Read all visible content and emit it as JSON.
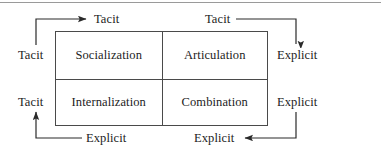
{
  "figure": {
    "type": "2x2-matrix-with-cycle-arrows",
    "line_color": "#4a4a4a",
    "text_color": "#1c1c1c",
    "background_color": "#ffffff"
  },
  "matrix": {
    "cells": [
      {
        "id": "socialization",
        "label": "Socialization",
        "row": "top",
        "col": "left"
      },
      {
        "id": "articulation",
        "label": "Articulation",
        "row": "top",
        "col": "right"
      },
      {
        "id": "internalization",
        "label": "Internalization",
        "row": "bottom",
        "col": "left"
      },
      {
        "id": "combination",
        "label": "Combination",
        "row": "bottom",
        "col": "right"
      }
    ]
  },
  "edge_labels": {
    "top_left": "Tacit",
    "top_right": "Tacit",
    "left_top": "Tacit",
    "left_bottom": "Tacit",
    "right_top": "Explicit",
    "right_bottom": "Explicit",
    "bottom_left": "Explicit",
    "bottom_right": "Explicit"
  },
  "arrows": [
    {
      "id": "left-up-to-top",
      "from": "left_top",
      "to": "top_left",
      "direction": "up-then-right",
      "head": "right"
    },
    {
      "id": "top-right-to-right",
      "from": "top_right",
      "to": "right_top",
      "direction": "right-then-down",
      "head": "down"
    },
    {
      "id": "right-down-to-bottom",
      "from": "right_bottom",
      "to": "bottom_right",
      "direction": "down-then-left",
      "head": "left"
    },
    {
      "id": "bottom-left-to-left",
      "from": "bottom_left",
      "to": "left_bottom",
      "direction": "left-then-up",
      "head": "up"
    }
  ]
}
